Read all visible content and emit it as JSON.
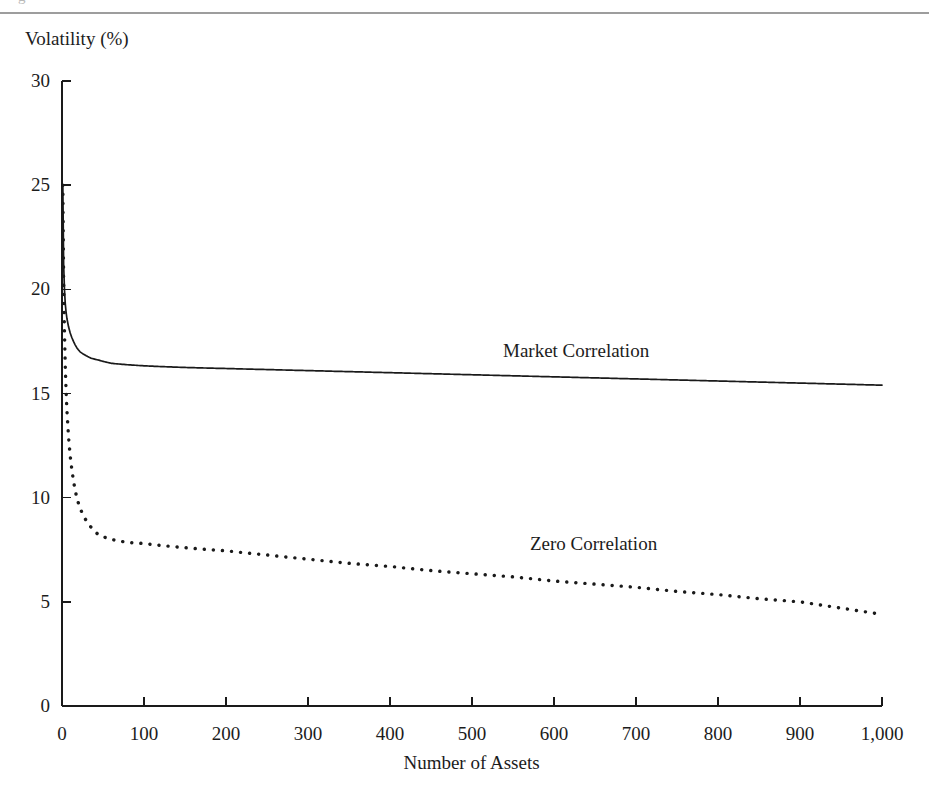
{
  "page": {
    "caption_remnant": "g",
    "top_rule_color": "#8c8c8c"
  },
  "figure": {
    "y_axis_title": "Volatility (%)",
    "x_axis_title": "Number of Assets",
    "axis_color": "#1a1a1a",
    "series_label_market": "Market Correlation",
    "series_label_zero": "Zero Correlation"
  },
  "chart_data": {
    "type": "line",
    "title": "",
    "subtitle": "",
    "xlabel": "Number of Assets",
    "ylabel": "Volatility (%)",
    "xlim": [
      0,
      1000
    ],
    "ylim": [
      0,
      30
    ],
    "grid": false,
    "legend": "inline-annotations",
    "xticks": [
      0,
      100,
      200,
      300,
      400,
      500,
      600,
      700,
      800,
      900,
      1000
    ],
    "xticklabels": [
      "0",
      "100",
      "200",
      "300",
      "400",
      "500",
      "600",
      "700",
      "800",
      "900",
      "1,000"
    ],
    "yticks": [
      0,
      5,
      10,
      15,
      20,
      25,
      30
    ],
    "yticklabels": [
      "0",
      "5",
      "10",
      "15",
      "20",
      "25",
      "30"
    ],
    "annotations": [
      {
        "text": "Market Correlation",
        "x": 560,
        "y": 17.6
      },
      {
        "text": "Zero Correlation",
        "x": 600,
        "y": 8.2
      }
    ],
    "series": [
      {
        "name": "Market Correlation",
        "style": "solid",
        "color": "#1a1a1a",
        "x": [
          1,
          2,
          3,
          4,
          5,
          6,
          8,
          10,
          12,
          15,
          20,
          25,
          30,
          40,
          50,
          60,
          80,
          100,
          150,
          200,
          250,
          300,
          350,
          400,
          450,
          500,
          550,
          600,
          650,
          700,
          750,
          800,
          850,
          900,
          950,
          1000
        ],
        "values": [
          25.0,
          21.65,
          20.41,
          19.76,
          19.36,
          19.09,
          18.75,
          18.54,
          18.41,
          18.26,
          18.11,
          18.02,
          17.96,
          17.88,
          17.84,
          17.81,
          17.78,
          17.76,
          17.73,
          17.72,
          17.71,
          17.71,
          17.71,
          17.7,
          17.7,
          17.7,
          17.7,
          17.7,
          17.7,
          17.7,
          17.69,
          17.69,
          17.69,
          17.69,
          17.69,
          17.69
        ]
      },
      {
        "name": "Zero Correlation",
        "style": "dotted",
        "color": "#1a1a1a",
        "x": [
          1,
          2,
          3,
          4,
          5,
          6,
          8,
          10,
          12,
          15,
          20,
          25,
          30,
          40,
          50,
          60,
          80,
          100,
          150,
          200,
          250,
          300,
          350,
          400,
          450,
          500,
          550,
          600,
          650,
          700,
          750,
          800,
          850,
          900,
          950,
          1000
        ],
        "values": [
          25.0,
          17.68,
          14.43,
          12.5,
          11.18,
          10.21,
          8.84,
          7.91,
          7.22,
          6.46,
          5.59,
          5.0,
          4.56,
          3.95,
          3.54,
          3.23,
          2.8,
          2.5,
          2.04,
          1.77,
          1.58,
          1.44,
          1.34,
          1.25,
          1.18,
          1.12,
          1.07,
          1.02,
          0.98,
          0.95,
          0.91,
          0.88,
          0.86,
          0.83,
          0.81,
          0.79
        ]
      }
    ]
  },
  "rendered_curves": {
    "market": {
      "sigma": 25,
      "points_xy": [
        [
          1,
          25.0
        ],
        [
          2,
          21.2
        ],
        [
          3,
          20.0
        ],
        [
          4,
          19.3
        ],
        [
          5,
          18.9
        ],
        [
          6,
          18.6
        ],
        [
          8,
          18.2
        ],
        [
          10,
          17.9
        ],
        [
          14,
          17.5
        ],
        [
          18,
          17.2
        ],
        [
          22,
          17.0
        ],
        [
          28,
          16.85
        ],
        [
          35,
          16.7
        ],
        [
          45,
          16.6
        ],
        [
          60,
          16.45
        ],
        [
          80,
          16.38
        ],
        [
          100,
          16.33
        ],
        [
          150,
          16.25
        ],
        [
          200,
          16.2
        ],
        [
          250,
          16.15
        ],
        [
          300,
          16.1
        ],
        [
          350,
          16.05
        ],
        [
          400,
          16.0
        ],
        [
          450,
          15.95
        ],
        [
          500,
          15.9
        ],
        [
          550,
          15.85
        ],
        [
          600,
          15.8
        ],
        [
          650,
          15.75
        ],
        [
          700,
          15.7
        ],
        [
          750,
          15.65
        ],
        [
          800,
          15.6
        ],
        [
          850,
          15.55
        ],
        [
          900,
          15.5
        ],
        [
          950,
          15.45
        ],
        [
          1000,
          15.4
        ]
      ]
    },
    "zero": {
      "sigma": 25,
      "points_xy": [
        [
          1,
          25.0
        ],
        [
          2,
          20.5
        ],
        [
          3,
          18.0
        ],
        [
          4,
          16.3
        ],
        [
          5,
          15.1
        ],
        [
          6,
          14.2
        ],
        [
          8,
          12.9
        ],
        [
          10,
          12.0
        ],
        [
          14,
          10.8
        ],
        [
          18,
          10.0
        ],
        [
          22,
          9.5
        ],
        [
          28,
          9.0
        ],
        [
          35,
          8.6
        ],
        [
          45,
          8.2
        ],
        [
          60,
          8.0
        ],
        [
          80,
          7.85
        ],
        [
          100,
          7.8
        ],
        [
          150,
          7.6
        ],
        [
          200,
          7.45
        ],
        [
          250,
          7.25
        ],
        [
          300,
          7.05
        ],
        [
          350,
          6.85
        ],
        [
          400,
          6.7
        ],
        [
          450,
          6.5
        ],
        [
          500,
          6.35
        ],
        [
          550,
          6.2
        ],
        [
          600,
          6.0
        ],
        [
          650,
          5.85
        ],
        [
          700,
          5.7
        ],
        [
          750,
          5.5
        ],
        [
          800,
          5.35
        ],
        [
          850,
          5.15
        ],
        [
          900,
          5.0
        ],
        [
          950,
          4.7
        ],
        [
          1000,
          4.4
        ]
      ]
    }
  }
}
